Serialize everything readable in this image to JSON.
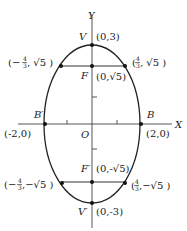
{
  "diagram": {
    "type": "ellipse",
    "equation_form": "vertical major axis, center at origin",
    "axes": {
      "x_label": "X",
      "y_label": "Y",
      "origin_label": "O"
    },
    "points": [
      {
        "name": "V",
        "label": "V",
        "coords": "(0,3)"
      },
      {
        "name": "F",
        "label": "F",
        "coords": "(0,√5)"
      },
      {
        "name": "B",
        "label": "B",
        "coords": "(2,0)"
      },
      {
        "name": "B'",
        "label": "B′",
        "coords": "(-2,0)"
      },
      {
        "name": "F'",
        "label": "F′",
        "coords": "(0,-√5)"
      },
      {
        "name": "V'",
        "label": "V′",
        "coords": "(0,-3)"
      }
    ],
    "latus_rectum_endpoints": {
      "upper_left": {
        "prefix": "(−",
        "frac_num": "4",
        "frac_den": "3",
        "suffix": ", √5 )"
      },
      "upper_right": {
        "prefix": "(",
        "frac_num": "4",
        "frac_den": "3",
        "suffix": ", √5 )"
      },
      "lower_left": {
        "prefix": "(−",
        "frac_num": "4",
        "frac_den": "3",
        "suffix": ",−√5 )"
      },
      "lower_right": {
        "prefix": "(",
        "frac_num": "4",
        "frac_den": "3",
        "suffix": ",−√5 )"
      }
    },
    "colors": {
      "stroke": "#222222",
      "axis": "#555555",
      "background": "#ffffff"
    }
  }
}
